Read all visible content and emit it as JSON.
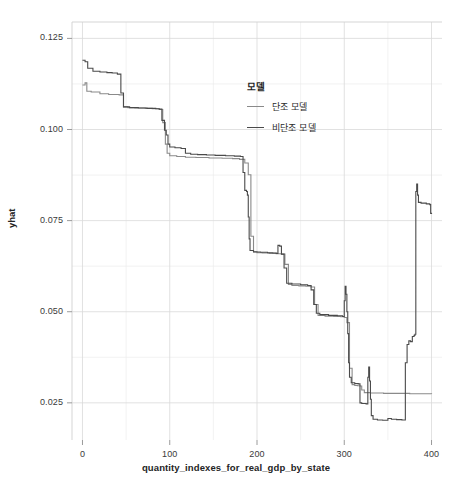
{
  "chart_data": {
    "type": "line",
    "title": "",
    "xlabel": "quantity_indexes_for_real_gdp_by_state",
    "ylabel": "yhat",
    "xlim": [
      -12,
      412
    ],
    "ylim": [
      0.0148,
      0.1295
    ],
    "xticks": [
      0,
      100,
      200,
      300,
      400
    ],
    "xtick_labels": [
      "0",
      "100",
      "200",
      "300",
      "400"
    ],
    "yticks": [
      0.025,
      0.05,
      0.075,
      0.1,
      0.125
    ],
    "ytick_labels": [
      "0.025",
      "0.050",
      "0.075",
      "0.100",
      "0.125"
    ],
    "x_minor_step": 50,
    "y_minor_step": 0.0125,
    "grid": true,
    "grid_color": "#d9d9d9",
    "minor_grid_color": "#ececec",
    "background": "#ffffff",
    "legend": {
      "title": "모델",
      "position": "upper-center-right",
      "entries": [
        {
          "name": "단조 모델",
          "color": "#8a8a8a"
        },
        {
          "name": "비단조 모델",
          "color": "#4a4a4a"
        }
      ]
    },
    "series": [
      {
        "name": "단조 모델",
        "color": "#8a8a8a",
        "linewidth": 1.1,
        "step": true,
        "points": [
          [
            0,
            0.1122
          ],
          [
            3,
            0.1128
          ],
          [
            5,
            0.1105
          ],
          [
            10,
            0.1103
          ],
          [
            20,
            0.1098
          ],
          [
            30,
            0.1096
          ],
          [
            42,
            0.1095
          ],
          [
            47,
            0.1062
          ],
          [
            52,
            0.106
          ],
          [
            60,
            0.1059
          ],
          [
            72,
            0.1058
          ],
          [
            80,
            0.1057
          ],
          [
            88,
            0.1055
          ],
          [
            92,
            0.1019
          ],
          [
            95,
            0.096
          ],
          [
            97,
            0.0935
          ],
          [
            100,
            0.0928
          ],
          [
            108,
            0.0926
          ],
          [
            118,
            0.0924
          ],
          [
            130,
            0.0923
          ],
          [
            145,
            0.0922
          ],
          [
            160,
            0.0921
          ],
          [
            172,
            0.092
          ],
          [
            180,
            0.0918
          ],
          [
            186,
            0.0908
          ],
          [
            190,
            0.0876
          ],
          [
            193,
            0.0707
          ],
          [
            196,
            0.0665
          ],
          [
            200,
            0.0662
          ],
          [
            206,
            0.0661
          ],
          [
            214,
            0.066
          ],
          [
            222,
            0.0659
          ],
          [
            228,
            0.0658
          ],
          [
            232,
            0.063
          ],
          [
            236,
            0.0575
          ],
          [
            240,
            0.0572
          ],
          [
            248,
            0.0571
          ],
          [
            256,
            0.057
          ],
          [
            262,
            0.0568
          ],
          [
            266,
            0.052
          ],
          [
            270,
            0.049
          ],
          [
            278,
            0.0488
          ],
          [
            288,
            0.0487
          ],
          [
            296,
            0.0486
          ],
          [
            300,
            0.0484
          ],
          [
            303,
            0.047
          ],
          [
            306,
            0.0345
          ],
          [
            309,
            0.03
          ],
          [
            312,
            0.0298
          ],
          [
            315,
            0.0297
          ],
          [
            318,
            0.0296
          ],
          [
            320,
            0.0285
          ],
          [
            323,
            0.0278
          ],
          [
            330,
            0.0277
          ],
          [
            345,
            0.0276
          ],
          [
            360,
            0.0276
          ],
          [
            375,
            0.0275
          ],
          [
            390,
            0.0275
          ],
          [
            400,
            0.0274
          ]
        ]
      },
      {
        "name": "비단조 모델",
        "color": "#4a4a4a",
        "linewidth": 1.1,
        "step": true,
        "points": [
          [
            0,
            0.119
          ],
          [
            3,
            0.1186
          ],
          [
            6,
            0.1168
          ],
          [
            12,
            0.116
          ],
          [
            20,
            0.1158
          ],
          [
            28,
            0.1156
          ],
          [
            34,
            0.1155
          ],
          [
            40,
            0.1152
          ],
          [
            44,
            0.11
          ],
          [
            47,
            0.1062
          ],
          [
            54,
            0.106
          ],
          [
            64,
            0.1059
          ],
          [
            74,
            0.1058
          ],
          [
            84,
            0.1057
          ],
          [
            88,
            0.1056
          ],
          [
            91,
            0.1025
          ],
          [
            94,
            0.0998
          ],
          [
            96,
            0.0985
          ],
          [
            98,
            0.096
          ],
          [
            100,
            0.0952
          ],
          [
            106,
            0.095
          ],
          [
            113,
            0.0948
          ],
          [
            118,
            0.0935
          ],
          [
            124,
            0.0932
          ],
          [
            132,
            0.0931
          ],
          [
            142,
            0.093
          ],
          [
            152,
            0.0929
          ],
          [
            164,
            0.0928
          ],
          [
            174,
            0.0927
          ],
          [
            181,
            0.0926
          ],
          [
            184,
            0.0882
          ],
          [
            186,
            0.0833
          ],
          [
            188,
            0.083
          ],
          [
            189,
            0.082
          ],
          [
            190,
            0.076
          ],
          [
            191,
            0.07
          ],
          [
            192,
            0.0668
          ],
          [
            196,
            0.0664
          ],
          [
            204,
            0.0663
          ],
          [
            212,
            0.0662
          ],
          [
            218,
            0.0661
          ],
          [
            222,
            0.066
          ],
          [
            224,
            0.0682
          ],
          [
            226,
            0.068
          ],
          [
            228,
            0.0658
          ],
          [
            231,
            0.062
          ],
          [
            234,
            0.0578
          ],
          [
            240,
            0.0576
          ],
          [
            250,
            0.0574
          ],
          [
            258,
            0.0572
          ],
          [
            262,
            0.056
          ],
          [
            265,
            0.052
          ],
          [
            268,
            0.0496
          ],
          [
            272,
            0.0492
          ],
          [
            282,
            0.049
          ],
          [
            292,
            0.0489
          ],
          [
            298,
            0.0487
          ],
          [
            300,
            0.053
          ],
          [
            301,
            0.057
          ],
          [
            302,
            0.0548
          ],
          [
            303,
            0.05
          ],
          [
            304,
            0.044
          ],
          [
            305,
            0.036
          ],
          [
            306,
            0.032
          ],
          [
            308,
            0.0305
          ],
          [
            312,
            0.0303
          ],
          [
            316,
            0.0302
          ],
          [
            318,
            0.025
          ],
          [
            320,
            0.0248
          ],
          [
            325,
            0.0247
          ],
          [
            327,
            0.032
          ],
          [
            328,
            0.0348
          ],
          [
            329,
            0.031
          ],
          [
            330,
            0.026
          ],
          [
            331,
            0.0215
          ],
          [
            333,
            0.0205
          ],
          [
            338,
            0.0203
          ],
          [
            344,
            0.0202
          ],
          [
            350,
            0.0207
          ],
          [
            354,
            0.0205
          ],
          [
            360,
            0.0204
          ],
          [
            366,
            0.0203
          ],
          [
            370,
            0.036
          ],
          [
            372,
            0.041
          ],
          [
            374,
            0.042
          ],
          [
            376,
            0.0418
          ],
          [
            378,
            0.0432
          ],
          [
            380,
            0.0435
          ],
          [
            381,
            0.0438
          ],
          [
            382,
            0.083
          ],
          [
            383,
            0.085
          ],
          [
            384,
            0.082
          ],
          [
            385,
            0.08
          ],
          [
            388,
            0.0798
          ],
          [
            394,
            0.0796
          ],
          [
            398,
            0.0794
          ],
          [
            399,
            0.077
          ],
          [
            400,
            0.0768
          ]
        ]
      }
    ]
  }
}
